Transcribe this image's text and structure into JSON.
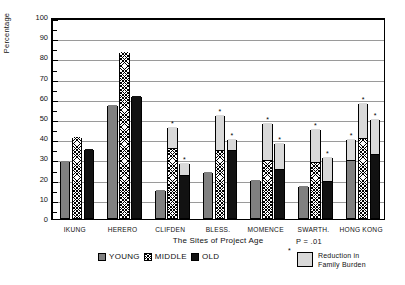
{
  "chart_data": {
    "type": "bar",
    "title": "",
    "xlabel": "The Sites of Project Age",
    "ylabel": "Percentage",
    "ylim": [
      0,
      100
    ],
    "ytick_step": 10,
    "yticks": [
      "100",
      "90",
      "80",
      "70",
      "60",
      "50",
      "40",
      "30",
      "20",
      "10",
      "0"
    ],
    "grid": true,
    "stacked": true,
    "categories": [
      "IKUNG",
      "HERERO",
      "CLIFDEN",
      "BLESS.",
      "MOMENCE",
      "SWARTH.",
      "HONG KONG"
    ],
    "series": [
      {
        "name": "YOUNG",
        "fill": "solid-gray",
        "values": [
          28,
          56,
          14,
          23,
          19,
          16,
          28
        ],
        "reduction": [
          0,
          0,
          0,
          0,
          0,
          0,
          11
        ],
        "totals": [
          28,
          56,
          14,
          23,
          19,
          16,
          39
        ],
        "significant": [
          false,
          false,
          false,
          false,
          false,
          false,
          true
        ]
      },
      {
        "name": "MIDDLE",
        "fill": "crosshatch",
        "values": [
          40,
          82,
          34,
          33,
          28,
          27,
          39
        ],
        "reduction": [
          0,
          0,
          11,
          18,
          19,
          17,
          18
        ],
        "totals": [
          40,
          82,
          45,
          51,
          47,
          44,
          57
        ],
        "significant": [
          false,
          false,
          true,
          true,
          true,
          true,
          true
        ]
      },
      {
        "name": "OLD",
        "fill": "solid-black",
        "values": [
          34,
          60.5,
          21,
          33,
          24,
          18,
          31
        ],
        "reduction": [
          0,
          0,
          6,
          6,
          13,
          12,
          18
        ],
        "totals": [
          34,
          60.5,
          27,
          39,
          37,
          30,
          49
        ],
        "significant": [
          false,
          false,
          true,
          true,
          true,
          true,
          true
        ]
      }
    ],
    "overlay_legend": {
      "swatch_label_line1": "Reduction in",
      "swatch_label_line2": "Family Burden",
      "star": "*"
    },
    "annotation": {
      "p_value": "P = .01"
    }
  },
  "legend": {
    "items": [
      {
        "label": "YOUNG",
        "fill": "solid-gray"
      },
      {
        "label": "MIDDLE",
        "fill": "crosshatch"
      },
      {
        "label": "OLD",
        "fill": "solid-black"
      }
    ]
  }
}
